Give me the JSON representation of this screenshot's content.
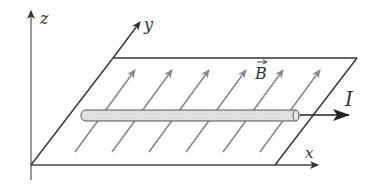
{
  "diagram": {
    "type": "physics-schematic",
    "labels": {
      "z_axis": "z",
      "y_axis": "y",
      "x_axis": "x",
      "field": "B",
      "current": "I"
    },
    "colors": {
      "axis": "#444444",
      "plane_edge": "#333333",
      "field_lines": "#8a8a8a",
      "rod_fill": "#dcdcdc",
      "rod_stroke": "#555555",
      "current_arrow": "#222222"
    },
    "field_line_count": 6
  }
}
